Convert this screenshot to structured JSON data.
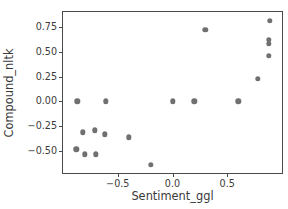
{
  "figure": {
    "clipped_title_text": "Sentiment",
    "background_color": "#ffffff",
    "axis_color": "#4a4a4a",
    "marker_color": "#707070",
    "text_color": "#3a3a3a"
  },
  "chart_data": {
    "type": "scatter",
    "title": "",
    "xlabel": "Sentiment_ggl",
    "ylabel": "Compound_nltk",
    "xlim": [
      -1.0,
      1.0
    ],
    "ylim": [
      -0.72,
      0.9
    ],
    "grid": false,
    "legend": null,
    "xticks": [
      -0.5,
      0.0,
      0.5
    ],
    "xticklabels": [
      "−0.5",
      "0.0",
      "0.5"
    ],
    "yticks": [
      0.75,
      0.5,
      0.25,
      0.0,
      -0.25,
      -0.5
    ],
    "yticklabels": [
      "0.75",
      "0.50",
      "0.25",
      "0.00",
      "−0.25",
      "−0.50"
    ],
    "marker": "circle",
    "marker_size": 5.4,
    "points": [
      {
        "x": -0.87,
        "y": 0.0
      },
      {
        "x": -0.88,
        "y": -0.48
      },
      {
        "x": -0.82,
        "y": -0.31
      },
      {
        "x": -0.8,
        "y": -0.53
      },
      {
        "x": -0.71,
        "y": -0.29
      },
      {
        "x": -0.7,
        "y": -0.53
      },
      {
        "x": -0.62,
        "y": -0.33
      },
      {
        "x": -0.61,
        "y": 0.0
      },
      {
        "x": -0.4,
        "y": -0.36
      },
      {
        "x": -0.2,
        "y": -0.64
      },
      {
        "x": 0.0,
        "y": 0.0
      },
      {
        "x": 0.2,
        "y": 0.0
      },
      {
        "x": 0.3,
        "y": 0.72
      },
      {
        "x": 0.6,
        "y": 0.0
      },
      {
        "x": 0.78,
        "y": 0.23
      },
      {
        "x": 0.88,
        "y": 0.46
      },
      {
        "x": 0.88,
        "y": 0.58
      },
      {
        "x": 0.88,
        "y": 0.62
      },
      {
        "x": 0.89,
        "y": 0.81
      }
    ]
  }
}
